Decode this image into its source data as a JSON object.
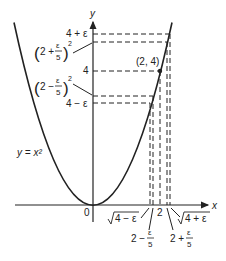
{
  "figure": {
    "curve_label": "y = x²",
    "axis_x_label": "x",
    "axis_y_label": "y",
    "origin_label": "0",
    "point_label": "(2, 4)",
    "y_labels": {
      "four_plus_eps": "4 + ε",
      "two_plus_sq": "(2 + ε/5)²",
      "four": "4",
      "two_minus_sq": "(2 − ε/5)²",
      "four_minus_eps": "4 − ε"
    },
    "x_labels": {
      "sqrt_four_minus_eps": "√(4 − ε)",
      "two": "2",
      "sqrt_four_plus_eps": "√(4 + ε)",
      "two_minus_eps5": "2 − ε/5",
      "two_plus_eps5": "2 + ε/5"
    },
    "colors": {
      "ink": "#222222",
      "background": "#ffffff"
    }
  }
}
